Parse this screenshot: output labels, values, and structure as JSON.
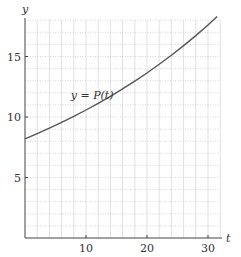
{
  "chart_data": {
    "type": "line",
    "title": "",
    "xlabel": "t",
    "ylabel": "y",
    "xlim": [
      0,
      32
    ],
    "ylim": [
      0,
      18
    ],
    "xticks": [
      10,
      20,
      30
    ],
    "yticks": [
      5,
      10,
      15
    ],
    "xtick_labels": [
      "10",
      "20",
      "30"
    ],
    "ytick_labels": [
      "5",
      "10",
      "15"
    ],
    "grid": true,
    "grid_x_step": 2,
    "grid_y_step": 1,
    "legend": null,
    "annotations": [
      {
        "text": "y = P(t)",
        "x": 7.5,
        "y": 11.5
      }
    ],
    "series": [
      {
        "name": "y = P(t)",
        "x": [
          0,
          2,
          4,
          6,
          8,
          10,
          12,
          14,
          16,
          18,
          20,
          22,
          24,
          26,
          28,
          30,
          31.5
        ],
        "values": [
          8.2,
          8.63,
          9.08,
          9.55,
          10.05,
          10.58,
          11.13,
          11.71,
          12.32,
          12.97,
          13.64,
          14.36,
          15.11,
          15.9,
          16.73,
          17.6,
          18.3
        ]
      }
    ],
    "colors": {
      "curve": "#555555",
      "axis": "#444444",
      "grid": "#cccccc"
    }
  }
}
